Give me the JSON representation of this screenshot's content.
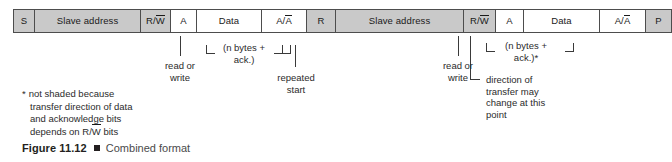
{
  "figure": {
    "number": "Figure 11.12",
    "marker": "square-bullet",
    "title": "Combined format"
  },
  "diagram": {
    "type": "i2c-frame-format",
    "shaded_color": "#c9c9c9",
    "plain_color": "#ffffff",
    "border_color": "#4d4d4d",
    "cells": [
      {
        "label": "S",
        "shaded": true,
        "width": 21
      },
      {
        "label": "Slave address",
        "shaded": true,
        "width": 106
      },
      {
        "label": "R/W",
        "shaded": true,
        "width": 30,
        "overline": "W"
      },
      {
        "label": "A",
        "shaded": false,
        "width": 26
      },
      {
        "label": "Data",
        "shaded": false,
        "width": 65
      },
      {
        "label": "A/A",
        "shaded": false,
        "width": 45,
        "overline": "A"
      },
      {
        "label": "R",
        "shaded": true,
        "width": 29
      },
      {
        "label": "Slave address",
        "shaded": true,
        "width": 128
      },
      {
        "label": "R/W",
        "shaded": true,
        "width": 32,
        "overline": "W"
      },
      {
        "label": "A",
        "shaded": false,
        "width": 28
      },
      {
        "label": "Data",
        "shaded": false,
        "width": 76
      },
      {
        "label": "A/A",
        "shaded": false,
        "width": 46,
        "overline": "A"
      },
      {
        "label": "P",
        "shaded": true,
        "width": 25
      }
    ]
  },
  "annotations": {
    "read_or_write_1": "read or\nwrite",
    "n_bytes_ack_1": "(n bytes +\nack.)",
    "repeated_start": "repeated\nstart",
    "read_or_write_2": "read or\nwrite",
    "n_bytes_ack_2": "(n bytes +\nack.)*",
    "direction_change": "direction of\ntransfer may\nchange at this\npoint"
  },
  "footnote": {
    "star": "*",
    "lines": [
      "not shaded because",
      "transfer direction of data",
      "and acknowledge bits",
      "depends on R/W bits"
    ],
    "overline_line_index": 3
  }
}
